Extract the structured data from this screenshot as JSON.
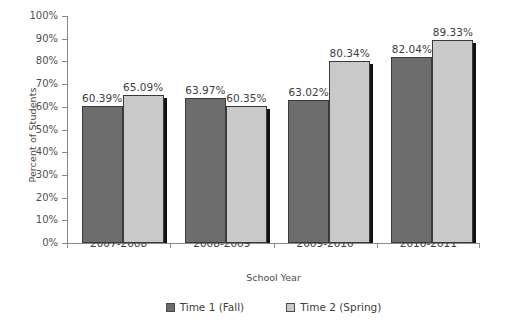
{
  "chart_data": {
    "type": "bar",
    "title": "",
    "xlabel": "School Year",
    "ylabel": "Percent of Students",
    "categories": [
      "2007-2008",
      "2008-2009",
      "2009-2010",
      "2010-2011"
    ],
    "series": [
      {
        "name": "Time 1 (Fall)",
        "color": "#6d6d6d",
        "values": [
          60.39,
          63.97,
          63.02,
          82.04
        ],
        "labels": [
          "60.39%",
          "63.97%",
          "63.02%",
          "82.04%"
        ]
      },
      {
        "name": "Time 2 (Spring)",
        "color": "#c9c9c9",
        "values": [
          65.09,
          60.35,
          80.34,
          89.33
        ],
        "labels": [
          "65.09%",
          "60.35%",
          "80.34%",
          "89.33%"
        ]
      }
    ],
    "ylim": [
      0,
      100
    ],
    "ytick_values": [
      0,
      10,
      20,
      30,
      40,
      50,
      60,
      70,
      80,
      90,
      100
    ],
    "ytick_labels": [
      "0%",
      "10%",
      "20%",
      "30%",
      "40%",
      "50%",
      "60%",
      "70%",
      "80%",
      "90%",
      "100%"
    ],
    "grid": false,
    "legend_position": "bottom"
  },
  "axes": {
    "y_title": "Percent of Students",
    "x_title": "School Year"
  },
  "legend": {
    "items": [
      {
        "label": "Time 1 (Fall)"
      },
      {
        "label": "Time 2 (Spring)"
      }
    ]
  },
  "colors": {
    "series1": "#6d6d6d",
    "series2": "#c9c9c9",
    "axis": "#8a8a8a",
    "text": "#3d3d3d",
    "background": "#ffffff"
  }
}
